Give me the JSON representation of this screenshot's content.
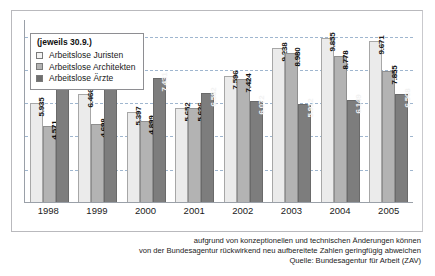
{
  "chart_data": {
    "type": "bar",
    "title": "",
    "subtitle": "(jeweils 30.9.)",
    "xlabel": "",
    "ylabel": "",
    "grid": true,
    "legend_position": "top-left",
    "ylim": [
      0,
      11000
    ],
    "gridline_values": [
      2000,
      4000,
      6000,
      8000,
      10000
    ],
    "categories": [
      "1998",
      "1999",
      "2000",
      "2001",
      "2002",
      "2003",
      "2004",
      "2005"
    ],
    "series": [
      {
        "name": "Arbeitslose Juristen",
        "color": "#ebebeb",
        "values": [
          5935,
          6466,
          5397,
          5652,
          7596,
          9238,
          9855,
          9671
        ],
        "labels": [
          "5.935",
          "6.466",
          "5.397",
          "5.652",
          "7.596",
          "9.238",
          "9.855",
          "9.671"
        ]
      },
      {
        "name": "Arbeitslose Architekten",
        "color": "#b3b3b3",
        "values": [
          4571,
          4698,
          4899,
          5636,
          7424,
          8980,
          8778,
          7855
        ],
        "labels": [
          "4.571",
          "4.698",
          "4.899",
          "5.636",
          "7.424",
          "8.980",
          "8.778",
          "7.855"
        ]
      },
      {
        "name": "Arbeitslose Ärzte",
        "color": "#7d7d7d",
        "values": [
          8802,
          8188,
          7431,
          6582,
          6072,
          5912,
          6149,
          6508
        ],
        "labels": [
          "8.802",
          "8.188",
          "7.431",
          "6.582",
          "6.072",
          "5.912",
          "6.149",
          "6.508"
        ]
      }
    ]
  },
  "legend": {
    "title": "(jeweils 30.9.)",
    "items": [
      {
        "label": "Arbeitslose Juristen"
      },
      {
        "label": "Arbeitslose Architekten"
      },
      {
        "label": "Arbeitslose Ärzte"
      }
    ]
  },
  "footnote": {
    "line1": "aufgrund von konzeptionellen und technischen Änderungen können",
    "line2": "von der Bundesagentur rückwirkend neu aufbereitete Zahlen geringfügig abweichen",
    "line3": "Quelle: Bundesagentur für Arbeit (ZAV)"
  }
}
